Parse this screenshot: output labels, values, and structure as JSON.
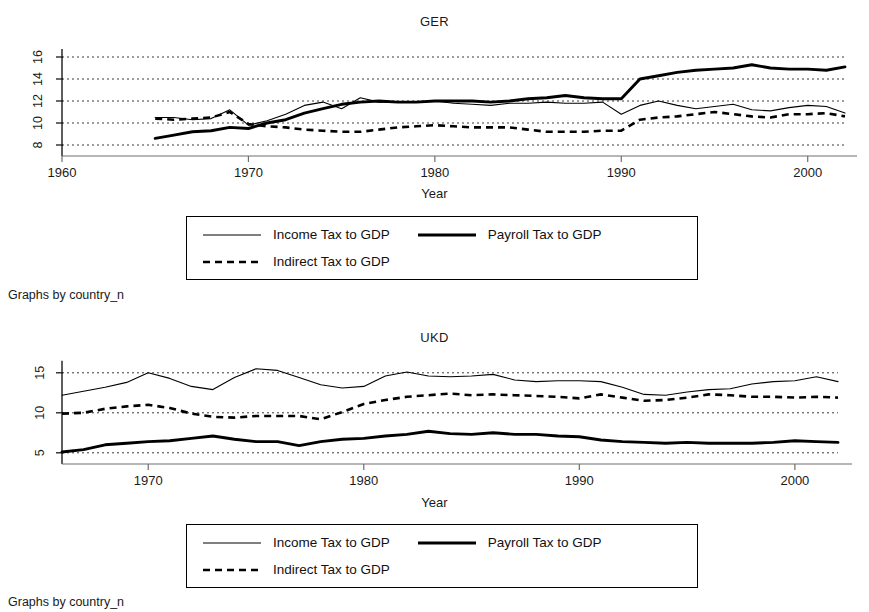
{
  "figure": {
    "caption_text": "Graphs by country_n",
    "x_axis_title": "Year",
    "legend": {
      "entries": [
        {
          "label": "Income Tax to GDP",
          "style": "thin-solid",
          "series_key": "income"
        },
        {
          "label": "Payroll Tax to GDP",
          "style": "thick-solid",
          "series_key": "payroll"
        },
        {
          "label": "Indirect Tax to GDP",
          "style": "dashed",
          "series_key": "indirect"
        }
      ]
    }
  },
  "chart_data": [
    {
      "id": "ger",
      "type": "line",
      "title": "GER",
      "xlabel": "Year",
      "ylabel": "",
      "xlim": [
        1960,
        2002
      ],
      "ylim": [
        7,
        17
      ],
      "xticks": [
        1960,
        1970,
        1980,
        1990,
        2000
      ],
      "yticks": [
        8,
        10,
        12,
        14,
        16
      ],
      "ytick_labels": [
        "8",
        "10",
        "12",
        "14",
        "16"
      ],
      "grid": true,
      "grid_axis": "y",
      "legend_position": "below",
      "x": [
        1965,
        1966,
        1967,
        1968,
        1969,
        1970,
        1971,
        1972,
        1973,
        1974,
        1975,
        1976,
        1977,
        1978,
        1979,
        1980,
        1981,
        1982,
        1983,
        1984,
        1985,
        1986,
        1987,
        1988,
        1989,
        1990,
        1991,
        1992,
        1993,
        1994,
        1995,
        1996,
        1997,
        1998,
        1999,
        2000,
        2001,
        2002
      ],
      "series": [
        {
          "name": "Income Tax to GDP",
          "key": "income",
          "values": [
            10.5,
            10.5,
            10.3,
            10.4,
            11.2,
            9.8,
            10.2,
            10.8,
            11.6,
            11.9,
            11.3,
            12.3,
            11.9,
            11.9,
            11.9,
            12.0,
            11.8,
            11.7,
            11.6,
            11.8,
            11.8,
            11.9,
            11.8,
            11.8,
            11.9,
            10.8,
            11.6,
            12.0,
            11.6,
            11.3,
            11.5,
            11.7,
            11.2,
            11.1,
            11.4,
            11.6,
            11.5,
            10.9
          ]
        },
        {
          "name": "Payroll Tax to GDP",
          "key": "payroll",
          "values": [
            8.6,
            8.9,
            9.2,
            9.3,
            9.6,
            9.5,
            10.0,
            10.3,
            10.9,
            11.3,
            11.7,
            11.9,
            12.0,
            11.9,
            11.9,
            12.0,
            12.0,
            12.0,
            11.9,
            12.0,
            12.2,
            12.3,
            12.5,
            12.3,
            12.2,
            12.2,
            14.0,
            14.3,
            14.6,
            14.8,
            14.9,
            15.0,
            15.3,
            15.0,
            14.9,
            14.9,
            14.8,
            15.1
          ]
        },
        {
          "name": "Indirect Tax to GDP",
          "key": "indirect",
          "values": [
            10.4,
            10.3,
            10.4,
            10.5,
            11.0,
            9.9,
            9.7,
            9.6,
            9.4,
            9.3,
            9.2,
            9.2,
            9.4,
            9.6,
            9.7,
            9.8,
            9.7,
            9.6,
            9.6,
            9.6,
            9.4,
            9.2,
            9.2,
            9.2,
            9.3,
            9.3,
            10.3,
            10.5,
            10.6,
            10.8,
            11.0,
            10.8,
            10.6,
            10.5,
            10.8,
            10.8,
            10.9,
            10.6
          ]
        }
      ]
    },
    {
      "id": "ukd",
      "type": "line",
      "title": "UKD",
      "xlabel": "Year",
      "ylabel": "",
      "xlim": [
        1966,
        2002
      ],
      "ylim": [
        3.6,
        16.6
      ],
      "xticks": [
        1970,
        1980,
        1990,
        2000
      ],
      "yticks": [
        5,
        10,
        15
      ],
      "ytick_labels": [
        "5",
        "10",
        "15"
      ],
      "grid": true,
      "grid_axis": "y",
      "legend_position": "below",
      "x": [
        1966,
        1967,
        1968,
        1969,
        1970,
        1971,
        1972,
        1973,
        1974,
        1975,
        1976,
        1977,
        1978,
        1979,
        1980,
        1981,
        1982,
        1983,
        1984,
        1985,
        1986,
        1987,
        1988,
        1989,
        1990,
        1991,
        1992,
        1993,
        1994,
        1995,
        1996,
        1997,
        1998,
        1999,
        2000,
        2001,
        2002
      ],
      "series": [
        {
          "name": "Income Tax to GDP",
          "key": "income",
          "values": [
            12.2,
            12.7,
            13.2,
            13.8,
            15.0,
            14.3,
            13.3,
            12.9,
            14.4,
            15.5,
            15.3,
            14.4,
            13.5,
            13.1,
            13.3,
            14.6,
            15.1,
            14.6,
            14.5,
            14.6,
            14.8,
            14.1,
            13.9,
            14.0,
            14.0,
            13.9,
            13.2,
            12.3,
            12.2,
            12.6,
            12.9,
            13.0,
            13.6,
            13.9,
            14.0,
            14.5,
            13.9
          ]
        },
        {
          "name": "Payroll Tax to GDP",
          "key": "payroll",
          "values": [
            5.1,
            5.4,
            6.0,
            6.2,
            6.4,
            6.5,
            6.8,
            7.1,
            6.7,
            6.4,
            6.4,
            5.9,
            6.4,
            6.7,
            6.8,
            7.1,
            7.3,
            7.7,
            7.4,
            7.3,
            7.5,
            7.3,
            7.3,
            7.1,
            7.0,
            6.6,
            6.4,
            6.3,
            6.2,
            6.3,
            6.2,
            6.2,
            6.2,
            6.3,
            6.5,
            6.4,
            6.3
          ]
        },
        {
          "name": "Indirect Tax to GDP",
          "key": "indirect",
          "values": [
            9.9,
            10.0,
            10.5,
            10.8,
            11.0,
            10.6,
            9.9,
            9.5,
            9.4,
            9.6,
            9.6,
            9.6,
            9.2,
            10.1,
            11.1,
            11.6,
            12.0,
            12.2,
            12.4,
            12.2,
            12.3,
            12.2,
            12.1,
            12.0,
            11.8,
            12.3,
            11.9,
            11.5,
            11.6,
            11.9,
            12.3,
            12.2,
            12.0,
            12.0,
            11.9,
            12.0,
            11.9
          ]
        }
      ]
    }
  ]
}
